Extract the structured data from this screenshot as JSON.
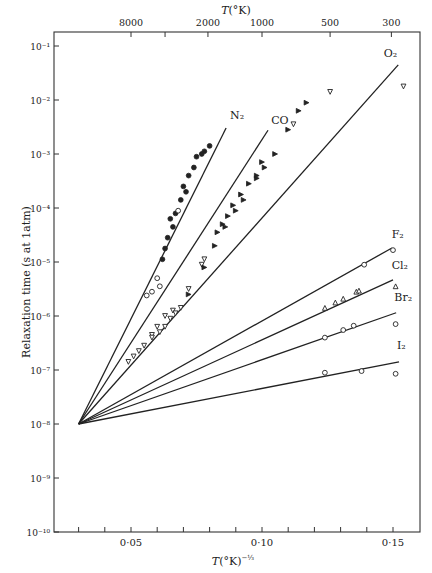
{
  "chart_data": {
    "type": "line",
    "title": "",
    "xlabel": "T(°K)^-1/3",
    "ylabel": "Relaxation time (s at 1atm)",
    "top_axis_label": "T(°K)",
    "top_ticks": [
      {
        "label": "8000",
        "T": 8000
      },
      {
        "label": "",
        "T": 4000
      },
      {
        "label": "2000",
        "T": 2000
      },
      {
        "label": "1000",
        "T": 1000
      },
      {
        "label": "500",
        "T": 500
      },
      {
        "label": "300",
        "T": 300
      }
    ],
    "x_ticks": [
      0.03,
      0.04,
      0.05,
      0.06,
      0.07,
      0.08,
      0.09,
      0.1,
      0.11,
      0.12,
      0.13,
      0.14,
      0.15
    ],
    "x_tick_labels": [
      {
        "value": 0.05,
        "label": "0·05"
      },
      {
        "value": 0.1,
        "label": "0·10"
      },
      {
        "value": 0.15,
        "label": "0·15"
      }
    ],
    "y_scale": "log",
    "y_ticks": [
      {
        "exp": -1,
        "label": "10⁻¹"
      },
      {
        "exp": -2,
        "label": "10⁻²"
      },
      {
        "exp": -3,
        "label": "10⁻³"
      },
      {
        "exp": -4,
        "label": "10⁻⁴"
      },
      {
        "exp": -5,
        "label": "10⁻⁵"
      },
      {
        "exp": -6,
        "label": "10⁻⁶"
      },
      {
        "exp": -7,
        "label": "10⁻⁷"
      },
      {
        "exp": -8,
        "label": "10⁻⁸"
      },
      {
        "exp": -9,
        "label": "10⁻⁹"
      },
      {
        "exp": -10,
        "label": "10⁻¹⁰"
      }
    ],
    "xlim": [
      0.0206,
      0.1603
    ],
    "ylim_log10": [
      -10,
      -0.75
    ],
    "grid": false,
    "convergence_point": {
      "x": 0.03,
      "log10_tau": -8
    },
    "series": [
      {
        "name": "N₂",
        "line_end": {
          "x": 0.0863,
          "log10_tau": -2.52
        },
        "label_pos": {
          "x": 0.0878,
          "log10_tau": -2.35
        },
        "points": [
          {
            "x": 0.056,
            "y": -5.62,
            "m": "o"
          },
          {
            "x": 0.058,
            "y": -5.55,
            "m": "o"
          },
          {
            "x": 0.061,
            "y": -5.45,
            "m": "o"
          },
          {
            "x": 0.06,
            "y": -5.3,
            "m": "o"
          },
          {
            "x": 0.062,
            "y": -4.95,
            "m": "f"
          },
          {
            "x": 0.063,
            "y": -4.75,
            "m": "f"
          },
          {
            "x": 0.064,
            "y": -4.55,
            "m": "f"
          },
          {
            "x": 0.066,
            "y": -4.35,
            "m": "f"
          },
          {
            "x": 0.067,
            "y": -4.1,
            "m": "f"
          },
          {
            "x": 0.069,
            "y": -3.85,
            "m": "f"
          },
          {
            "x": 0.07,
            "y": -3.6,
            "m": "f"
          },
          {
            "x": 0.072,
            "y": -3.4,
            "m": "f"
          },
          {
            "x": 0.074,
            "y": -3.25,
            "m": "f"
          },
          {
            "x": 0.075,
            "y": -3.05,
            "m": "f"
          },
          {
            "x": 0.078,
            "y": -2.95,
            "m": "f"
          },
          {
            "x": 0.08,
            "y": -2.85,
            "m": "f"
          },
          {
            "x": 0.068,
            "y": -4.05,
            "m": "o"
          },
          {
            "x": 0.065,
            "y": -4.2,
            "m": "f"
          },
          {
            "x": 0.071,
            "y": -3.7,
            "m": "f"
          },
          {
            "x": 0.077,
            "y": -3.0,
            "m": "f"
          }
        ]
      },
      {
        "name": "CO",
        "line_end": {
          "x": 0.1023,
          "log10_tau": -2.56
        },
        "label_pos": {
          "x": 0.1035,
          "log10_tau": -2.45
        },
        "points": [
          {
            "x": 0.058,
            "y": -6.35,
            "m": "v"
          },
          {
            "x": 0.06,
            "y": -6.2,
            "m": "v"
          },
          {
            "x": 0.063,
            "y": -6.0,
            "m": "v"
          },
          {
            "x": 0.066,
            "y": -5.9,
            "m": "v"
          },
          {
            "x": 0.072,
            "y": -5.5,
            "m": "v"
          },
          {
            "x": 0.077,
            "y": -5.05,
            "m": "v"
          },
          {
            "x": 0.078,
            "y": -4.95,
            "m": "v"
          },
          {
            "x": 0.083,
            "y": -4.45,
            "m": "tf"
          },
          {
            "x": 0.085,
            "y": -4.3,
            "m": "tf"
          },
          {
            "x": 0.087,
            "y": -4.15,
            "m": "tf"
          },
          {
            "x": 0.089,
            "y": -3.95,
            "m": "tf"
          },
          {
            "x": 0.092,
            "y": -3.75,
            "m": "tf"
          },
          {
            "x": 0.095,
            "y": -3.55,
            "m": "tf"
          },
          {
            "x": 0.098,
            "y": -3.4,
            "m": "tf"
          },
          {
            "x": 0.1,
            "y": -3.15,
            "m": "tf"
          }
        ]
      },
      {
        "name": "O₂",
        "line_end": {
          "x": 0.152,
          "log10_tau": -1.35
        },
        "label_pos": {
          "x": 0.1465,
          "log10_tau": -1.2
        },
        "points": [
          {
            "x": 0.049,
            "y": -6.85,
            "m": "v"
          },
          {
            "x": 0.051,
            "y": -6.75,
            "m": "v"
          },
          {
            "x": 0.053,
            "y": -6.65,
            "m": "v"
          },
          {
            "x": 0.055,
            "y": -6.55,
            "m": "v"
          },
          {
            "x": 0.058,
            "y": -6.4,
            "m": "v"
          },
          {
            "x": 0.061,
            "y": -6.3,
            "m": "v"
          },
          {
            "x": 0.063,
            "y": -6.2,
            "m": "v"
          },
          {
            "x": 0.065,
            "y": -6.05,
            "m": "v"
          },
          {
            "x": 0.067,
            "y": -5.95,
            "m": "v"
          },
          {
            "x": 0.069,
            "y": -5.85,
            "m": "v"
          },
          {
            "x": 0.072,
            "y": -5.6,
            "m": "tf"
          },
          {
            "x": 0.078,
            "y": -5.1,
            "m": "tf"
          },
          {
            "x": 0.082,
            "y": -4.7,
            "m": "tf"
          },
          {
            "x": 0.086,
            "y": -4.35,
            "m": "tf"
          },
          {
            "x": 0.09,
            "y": -4.05,
            "m": "tf"
          },
          {
            "x": 0.093,
            "y": -3.85,
            "m": "tf"
          },
          {
            "x": 0.098,
            "y": -3.45,
            "m": "tf"
          },
          {
            "x": 0.101,
            "y": -3.25,
            "m": "tf"
          },
          {
            "x": 0.105,
            "y": -3.0,
            "m": "tf"
          },
          {
            "x": 0.11,
            "y": -2.55,
            "m": "tf"
          },
          {
            "x": 0.112,
            "y": -2.45,
            "m": "v"
          },
          {
            "x": 0.114,
            "y": -2.2,
            "m": "tf"
          },
          {
            "x": 0.117,
            "y": -2.05,
            "m": "tf"
          },
          {
            "x": 0.126,
            "y": -1.85,
            "m": "v"
          },
          {
            "x": 0.154,
            "y": -1.75,
            "m": "v"
          }
        ]
      },
      {
        "name": "F₂",
        "line_end": {
          "x": 0.1496,
          "log10_tau": -4.74
        },
        "label_pos": {
          "x": 0.1495,
          "log10_tau": -4.55
        },
        "points": [
          {
            "x": 0.139,
            "y": -5.05,
            "m": "o"
          },
          {
            "x": 0.15,
            "y": -4.78,
            "m": "o"
          }
        ]
      },
      {
        "name": "Cl₂",
        "line_end": {
          "x": 0.15,
          "log10_tau": -5.33
        },
        "label_pos": {
          "x": 0.1495,
          "log10_tau": -5.13
        },
        "points": [
          {
            "x": 0.124,
            "y": -5.85,
            "m": "t"
          },
          {
            "x": 0.128,
            "y": -5.75,
            "m": "t"
          },
          {
            "x": 0.131,
            "y": -5.68,
            "m": "t"
          },
          {
            "x": 0.136,
            "y": -5.55,
            "m": "t"
          },
          {
            "x": 0.137,
            "y": -5.53,
            "m": "t"
          },
          {
            "x": 0.151,
            "y": -5.45,
            "m": "t"
          }
        ]
      },
      {
        "name": "Br₂",
        "line_end": {
          "x": 0.1512,
          "log10_tau": -5.94
        },
        "label_pos": {
          "x": 0.1505,
          "log10_tau": -5.72
        },
        "points": [
          {
            "x": 0.124,
            "y": -6.4,
            "m": "o"
          },
          {
            "x": 0.131,
            "y": -6.26,
            "m": "o"
          },
          {
            "x": 0.135,
            "y": -6.18,
            "m": "o"
          },
          {
            "x": 0.151,
            "y": -6.15,
            "m": "o"
          }
        ]
      },
      {
        "name": "I₂",
        "line_end": {
          "x": 0.1523,
          "log10_tau": -6.85
        },
        "label_pos": {
          "x": 0.1515,
          "log10_tau": -6.62
        },
        "points": [
          {
            "x": 0.124,
            "y": -7.05,
            "m": "o"
          },
          {
            "x": 0.138,
            "y": -7.02,
            "m": "o"
          },
          {
            "x": 0.151,
            "y": -7.07,
            "m": "o"
          }
        ]
      }
    ],
    "marker_legend": {
      "o": "open circle",
      "f": "filled circle",
      "v": "open triangle (down)",
      "t": "open triangle (up)",
      "tf": "filled triangle"
    },
    "legend": null
  }
}
